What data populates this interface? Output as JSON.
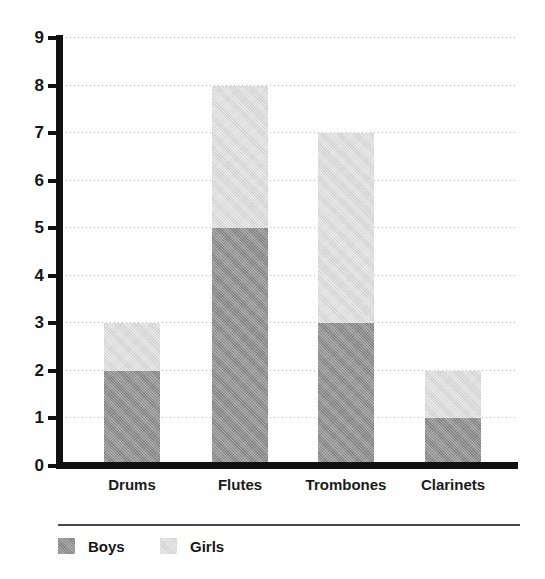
{
  "chart_data": {
    "type": "bar",
    "subtype": "stacked-vertical-bar",
    "title": "",
    "subtitle": "",
    "xlabel": "",
    "ylabel": "",
    "categories": [
      "Drums",
      "Flutes",
      "Trombones",
      "Clarinets"
    ],
    "series": [
      {
        "name": "Boys",
        "values": [
          2,
          5,
          3,
          1
        ],
        "color": "#8d8d8d"
      },
      {
        "name": "Girls",
        "values": [
          1,
          3,
          4,
          1
        ],
        "color": "#dadada"
      }
    ],
    "totals": [
      3,
      8,
      7,
      2
    ],
    "ylim": [
      0,
      9
    ],
    "ytick_values": [
      0,
      1,
      2,
      3,
      4,
      5,
      6,
      7,
      8,
      9
    ],
    "ytick_labels": [
      "0",
      "1",
      "2",
      "3",
      "4",
      "5",
      "6",
      "7",
      "8",
      "9"
    ],
    "grid": true,
    "grid_style": "dotted",
    "grid_axis": "y",
    "legend": true,
    "legend_position": "bottom-left",
    "legend_entries": [
      "Boys",
      "Girls"
    ],
    "axis_color": "#111111",
    "grid_color": "#b5b5b5",
    "background_color": "#ffffff"
  }
}
